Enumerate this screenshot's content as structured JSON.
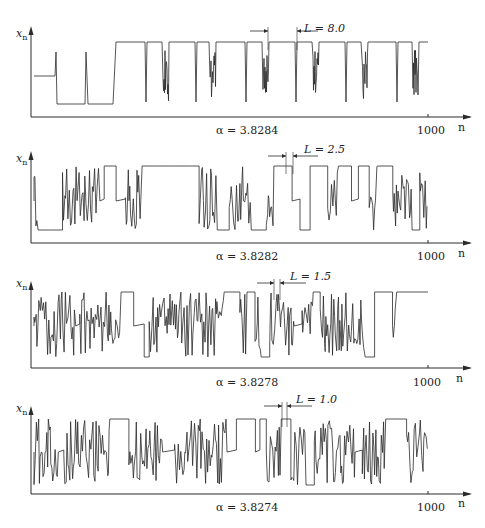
{
  "figure": {
    "y_axis_label": "x",
    "y_axis_sub": "n",
    "x_axis_label": "n",
    "x_tick_label": "1000",
    "line_color": "#2a2a2a"
  },
  "chart_data": [
    {
      "type": "line",
      "title": "α = 3.8284",
      "alpha": 3.8284,
      "annotation": "L = 8.0",
      "L_value": 8.0,
      "xlabel": "n",
      "ylabel": "x_n",
      "x_range": [
        0,
        1000
      ],
      "x_ticks": [
        1000
      ],
      "description": "Type-I intermittency near the period-3 window: long laminar (period-3) phases separated by short chaotic bursts",
      "laminar_fraction": 0.9
    },
    {
      "type": "line",
      "title": "α = 3.8282",
      "alpha": 3.8282,
      "annotation": "L = 2.5",
      "L_value": 2.5,
      "xlabel": "n",
      "ylabel": "x_n",
      "x_range": [
        0,
        1000
      ],
      "x_ticks": [
        1000
      ],
      "laminar_fraction": 0.55
    },
    {
      "type": "line",
      "title": "α = 3.8278",
      "alpha": 3.8278,
      "annotation": "L = 1.5",
      "L_value": 1.5,
      "xlabel": "n",
      "ylabel": "x_n",
      "x_range": [
        0,
        1000
      ],
      "x_ticks": [
        1000
      ],
      "laminar_fraction": 0.4
    },
    {
      "type": "line",
      "title": "α = 3.8274",
      "alpha": 3.8274,
      "annotation": "L = 1.0",
      "L_value": 1.0,
      "xlabel": "n",
      "ylabel": "x_n",
      "x_range": [
        0,
        1000
      ],
      "x_ticks": [
        1000
      ],
      "laminar_fraction": 0.3
    }
  ],
  "panels": [
    {
      "title": "α = 3.8284",
      "annotation": "L = 8.0"
    },
    {
      "title": "α = 3.8282",
      "annotation": "L = 2.5"
    },
    {
      "title": "α = 3.8278",
      "annotation": "L = 1.5"
    },
    {
      "title": "α = 3.8274",
      "annotation": "L = 1.0"
    }
  ]
}
